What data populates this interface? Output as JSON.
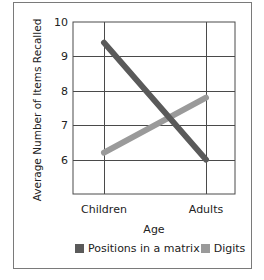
{
  "chart_data": {
    "type": "line",
    "title": "",
    "xlabel": "Age",
    "ylabel": "Average Number of Items Recalled",
    "categories": [
      "Children",
      "Adults"
    ],
    "series": [
      {
        "name": "Positions in a matrix",
        "color": "#5a5a5a",
        "values": [
          9.4,
          6.0
        ]
      },
      {
        "name": "Digits",
        "color": "#9a9a9a",
        "values": [
          6.2,
          7.8
        ]
      }
    ],
    "ylim": [
      5,
      10
    ],
    "yticks": [
      10,
      9,
      8,
      7,
      6
    ],
    "grid": true,
    "legend_position": "bottom"
  },
  "labels": {
    "ytick_10": "10",
    "ytick_9": "9",
    "ytick_8": "8",
    "ytick_7": "7",
    "ytick_6": "6",
    "x_children": "Children",
    "x_adults": "Adults"
  }
}
